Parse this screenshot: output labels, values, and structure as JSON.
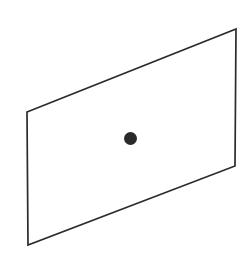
{
  "figure": {
    "type": "geometric-diagram",
    "canvas": {
      "width": 245,
      "height": 264,
      "background_color": "#ffffff"
    },
    "plane": {
      "label": "plane",
      "shape": "parallelogram",
      "fill_color": "#ffffff",
      "stroke_color": "#2b2b2b",
      "stroke_width": 1.7,
      "points_path": "27,112 236,29 235,166 28,245",
      "vertices": [
        {
          "name": "top-left",
          "x": 27,
          "y": 112
        },
        {
          "name": "top-right",
          "x": 236,
          "y": 29
        },
        {
          "name": "bottom-right",
          "x": 235,
          "y": 166
        },
        {
          "name": "bottom-left",
          "x": 28,
          "y": 245
        }
      ]
    },
    "point": {
      "label": "point",
      "color": "#2a2a2a",
      "center_x": 130.5,
      "center_y": 138.5,
      "radius": 6.5,
      "diameter": 13
    }
  }
}
